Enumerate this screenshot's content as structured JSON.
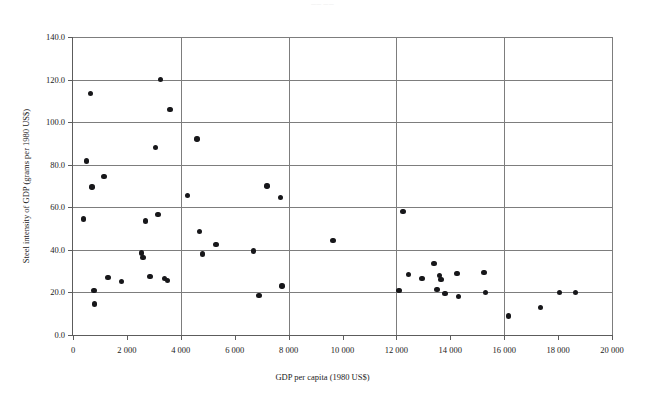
{
  "figure": {
    "top_fragment": "——  ——",
    "bottom_ghost": "",
    "background_color": "#ffffff",
    "marker_color": "#17171a",
    "grid_color": "#7d7d7d",
    "axis_color": "#5c5c5c"
  },
  "chart_data": {
    "type": "scatter",
    "title": "",
    "xlabel": "GDP per capita (1980 US$)",
    "ylabel": "Steel intensity of GDP (grams per 1980 US$)",
    "xlim": [
      0,
      20000
    ],
    "ylim": [
      0,
      140
    ],
    "grid": true,
    "legend": null,
    "xticks": [
      0,
      2000,
      4000,
      6000,
      8000,
      10000,
      12000,
      14000,
      16000,
      18000,
      20000
    ],
    "xtick_labels": [
      "0",
      "2 000",
      "4 000",
      "6 000",
      "8 000",
      "10 000",
      "12 000",
      "14 000",
      "16 000",
      "18 000",
      "20 000"
    ],
    "yticks": [
      0,
      20,
      40,
      60,
      80,
      100,
      120,
      140
    ],
    "ytick_labels": [
      "0.0",
      "20.0",
      "40.0",
      "60.0",
      "80.0",
      "100.0",
      "120.0",
      "140.0"
    ],
    "xgridlines": [
      4000,
      8000,
      12000,
      16000,
      20000
    ],
    "ygridlines": [
      20,
      40,
      60,
      80,
      100,
      120,
      140
    ],
    "points": [
      {
        "x": 400,
        "y": 54.5
      },
      {
        "x": 500,
        "y": 81.8
      },
      {
        "x": 650,
        "y": 113.5
      },
      {
        "x": 700,
        "y": 69.5
      },
      {
        "x": 780,
        "y": 21.0
      },
      {
        "x": 800,
        "y": 14.5
      },
      {
        "x": 1150,
        "y": 74.5
      },
      {
        "x": 1300,
        "y": 27.0
      },
      {
        "x": 1800,
        "y": 25.0
      },
      {
        "x": 2550,
        "y": 38.5
      },
      {
        "x": 2600,
        "y": 36.5
      },
      {
        "x": 2700,
        "y": 53.5
      },
      {
        "x": 2850,
        "y": 27.5
      },
      {
        "x": 3050,
        "y": 88.0
      },
      {
        "x": 3150,
        "y": 56.5
      },
      {
        "x": 3250,
        "y": 120.0
      },
      {
        "x": 3400,
        "y": 26.5
      },
      {
        "x": 3500,
        "y": 25.5
      },
      {
        "x": 3600,
        "y": 106.0
      },
      {
        "x": 4250,
        "y": 65.5
      },
      {
        "x": 4600,
        "y": 92.0
      },
      {
        "x": 4700,
        "y": 48.5
      },
      {
        "x": 4800,
        "y": 38.0
      },
      {
        "x": 5300,
        "y": 42.5
      },
      {
        "x": 6700,
        "y": 39.5
      },
      {
        "x": 6900,
        "y": 18.5
      },
      {
        "x": 7200,
        "y": 70.0
      },
      {
        "x": 7700,
        "y": 64.5
      },
      {
        "x": 7750,
        "y": 23.0
      },
      {
        "x": 9650,
        "y": 44.5
      },
      {
        "x": 12100,
        "y": 21.0
      },
      {
        "x": 12250,
        "y": 58.0
      },
      {
        "x": 12450,
        "y": 28.5
      },
      {
        "x": 12950,
        "y": 26.5
      },
      {
        "x": 13400,
        "y": 33.5
      },
      {
        "x": 13500,
        "y": 21.5
      },
      {
        "x": 13600,
        "y": 28.0
      },
      {
        "x": 13650,
        "y": 26.0
      },
      {
        "x": 13800,
        "y": 19.5
      },
      {
        "x": 14250,
        "y": 29.0
      },
      {
        "x": 14300,
        "y": 18.0
      },
      {
        "x": 15250,
        "y": 29.5
      },
      {
        "x": 15300,
        "y": 20.0
      },
      {
        "x": 16150,
        "y": 9.0
      },
      {
        "x": 17350,
        "y": 13.0
      },
      {
        "x": 18050,
        "y": 20.0
      },
      {
        "x": 18650,
        "y": 20.0
      }
    ]
  }
}
